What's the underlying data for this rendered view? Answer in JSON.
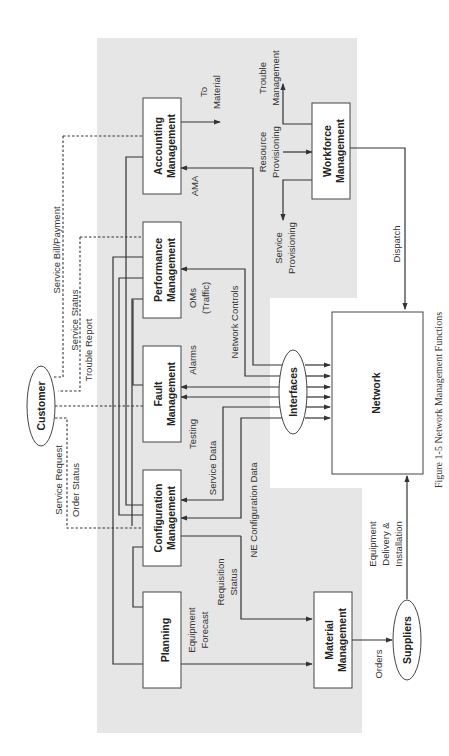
{
  "figure": {
    "caption": "Figure 1-5   Network Management Functions",
    "orientation": "rotated 90° counter-clockwise",
    "colors": {
      "panel": "#e6e6e6",
      "box_fill": "#ffffff",
      "stroke": "#333333"
    }
  },
  "nodes": {
    "customer": "Customer",
    "planning": [
      "Planning"
    ],
    "configuration": [
      "Configuration",
      "Management"
    ],
    "fault": [
      "Fault",
      "Management"
    ],
    "performance": [
      "Performance",
      "Management"
    ],
    "accounting": [
      "Accounting",
      "Management"
    ],
    "material": [
      "Material",
      "Management"
    ],
    "workforce": [
      "Workforce",
      "Management"
    ],
    "interfaces": "Interfaces",
    "network": "Network",
    "suppliers": "Suppliers"
  },
  "labels": {
    "service_request": "Service Request",
    "order_status": "Order Status",
    "service_status": "Service Status",
    "trouble_report": "Trouble Report",
    "service_bill": "Service Bill/Payment",
    "to_material_1": "To",
    "to_material_2": "Material",
    "trouble_mgmt_1": "Trouble",
    "trouble_mgmt_2": "Management",
    "resource_prov_1": "Resource",
    "resource_prov_2": "Provisioning",
    "service_prov_1": "Service",
    "service_prov_2": "Provisioning",
    "ama": "AMA",
    "oms_1": "OMs",
    "oms_2": "(Traffic)",
    "network_controls": "Network Controls",
    "alarms": "Alarms",
    "testing": "Testing",
    "service_data": "Service Data",
    "ne_config_data": "NE Configuration Data",
    "requisition_1": "Requisition",
    "requisition_2": "Status",
    "equip_forecast_1": "Equipment",
    "equip_forecast_2": "Forecast",
    "orders": "Orders",
    "equip_delivery_1": "Equipment",
    "equip_delivery_2": "Delivery &",
    "equip_delivery_3": "Installation",
    "dispatch": "Dispatch"
  }
}
